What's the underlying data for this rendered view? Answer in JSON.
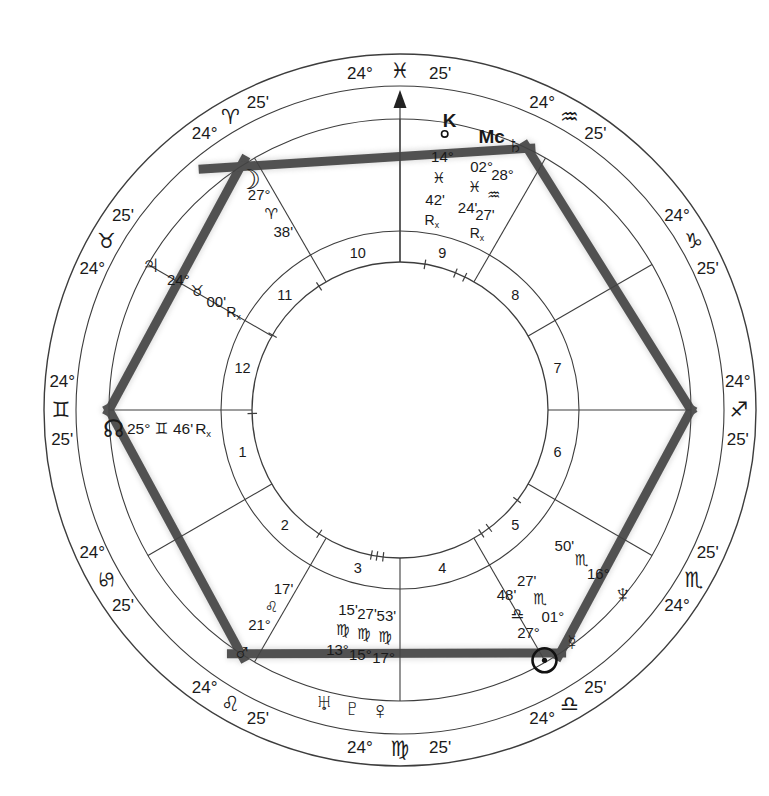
{
  "page_top": {
    "fragments": [
      {
        "ch": "g",
        "x": 103
      },
      {
        "ch": "y,",
        "x": 152
      },
      {
        "ch": "y",
        "x": 278
      },
      {
        "ch": "y",
        "x": 350
      },
      {
        "ch": "p",
        "x": 477
      },
      {
        "ch": "g",
        "x": 590
      },
      {
        "ch": "g",
        "x": 617
      }
    ]
  },
  "wheel": {
    "title": "natal chart wheel",
    "cusp_degree": "24°",
    "cusp_minute": "25'",
    "signs": [
      {
        "name": "aries",
        "glyph": "♈"
      },
      {
        "name": "taurus",
        "glyph": "♉"
      },
      {
        "name": "gemini",
        "glyph": "♊"
      },
      {
        "name": "cancer",
        "glyph": "♋"
      },
      {
        "name": "leo",
        "glyph": "♌"
      },
      {
        "name": "virgo",
        "glyph": "♍"
      },
      {
        "name": "libra",
        "glyph": "♎"
      },
      {
        "name": "scorpio",
        "glyph": "♏"
      },
      {
        "name": "sagittarius",
        "glyph": "♐"
      },
      {
        "name": "capricorn",
        "glyph": "♑"
      },
      {
        "name": "aquarius",
        "glyph": "♒"
      },
      {
        "name": "pisces",
        "glyph": "♓"
      }
    ],
    "house_numbers": [
      "1",
      "2",
      "3",
      "4",
      "5",
      "6",
      "7",
      "8",
      "9",
      "10",
      "11",
      "12"
    ],
    "retrograde_label": "R",
    "retrograde_sub": "x",
    "planets": [
      {
        "id": "sun",
        "name": "Sun",
        "glyph_type": "disc",
        "degree": "27°",
        "sign_glyph": "♎",
        "minute": "48'",
        "retrograde": false,
        "sign_index": 6,
        "deg": 27,
        "min": 48,
        "display_theta": 300
      },
      {
        "id": "moon",
        "name": "Moon",
        "glyph": "☽",
        "glyph_size": 27,
        "glyph_r": 276,
        "degree": "27°",
        "sign_glyph": "♈",
        "minute": "38'",
        "retrograde": false,
        "sign_index": 0,
        "deg": 27,
        "min": 38
      },
      {
        "id": "mercury",
        "name": "Mercury",
        "glyph": "☿",
        "glyph_size": 22,
        "degree": "01°",
        "sign_glyph": "♏",
        "minute": "27'",
        "retrograde": false,
        "sign_index": 7,
        "deg": 1,
        "min": 27,
        "display_theta": 306.5
      },
      {
        "id": "venus",
        "name": "Venus",
        "glyph": "♀",
        "glyph_size": 25,
        "glyph_r": 301,
        "degree": "17°",
        "sign_glyph": "♍",
        "minute": "53'",
        "retrograde": false,
        "sign_index": 5,
        "deg": 17,
        "min": 53,
        "display_theta": 266.2,
        "compact": true
      },
      {
        "id": "mars",
        "name": "Mars",
        "glyph": "♂",
        "glyph_size": 25,
        "degree": "21°",
        "sign_glyph": "♌",
        "minute": "17'",
        "retrograde": false,
        "sign_index": 4,
        "deg": 21,
        "min": 17
      },
      {
        "id": "jupiter",
        "name": "Jupiter",
        "glyph": "♃",
        "glyph_size": 26,
        "degree": "24°",
        "sign_glyph": "♉",
        "minute": "00'",
        "retrograde": true,
        "sign_index": 1,
        "deg": 24,
        "min": 0
      },
      {
        "id": "saturn",
        "name": "Saturn",
        "glyph": "♄",
        "glyph_size": 24,
        "degree": "28°",
        "sign_glyph": "♒",
        "minute": "27'",
        "retrograde": true,
        "sign_index": 10,
        "deg": 28,
        "min": 27,
        "display_theta": 66.5
      },
      {
        "id": "uranus",
        "name": "Uranus",
        "glyph": "♅",
        "glyph_size": 24,
        "glyph_r": 301,
        "degree": "13°",
        "sign_glyph": "♍",
        "minute": "15'",
        "retrograde": false,
        "sign_index": 5,
        "deg": 13,
        "min": 15,
        "display_theta": 255.4,
        "compact": true
      },
      {
        "id": "neptune",
        "name": "Neptune",
        "glyph": "♆",
        "glyph_size": 26,
        "degree": "16°",
        "sign_glyph": "♏",
        "minute": "50'",
        "retrograde": false,
        "sign_index": 7,
        "deg": 16,
        "min": 50,
        "display_theta": 320.5
      },
      {
        "id": "pluto",
        "name": "Pluto",
        "glyph": "♇",
        "glyph_size": 24,
        "glyph_r": 301,
        "degree": "15°",
        "sign_glyph": "♍",
        "minute": "27'",
        "retrograde": false,
        "sign_index": 5,
        "deg": 15,
        "min": 27,
        "display_theta": 260.8,
        "compact": true
      },
      {
        "id": "north-node",
        "name": "North Node",
        "glyph": "☊",
        "glyph_size": 24,
        "glyph_r": 287,
        "degree": "25°",
        "sign_glyph": "♊",
        "minute": "46'",
        "retrograde": true,
        "sign_index": 2,
        "deg": 25,
        "min": 46,
        "display_theta": 183.8,
        "layout": "horizontal"
      },
      {
        "id": "chiron",
        "name": "Chiron",
        "glyph_type": "chiron",
        "chiron_letter": "K",
        "degree": "14°",
        "sign_glyph": "♓",
        "minute": "42'",
        "retrograde": true,
        "sign_index": 11,
        "deg": 14,
        "min": 42,
        "display_theta": 80.5
      },
      {
        "id": "mc",
        "name": "Midheaven",
        "label": "Mc",
        "degree": "02°",
        "sign_glyph": "♓",
        "minute": "24'",
        "retrograde": false,
        "sign_index": 11,
        "deg": 2,
        "min": 24,
        "display_theta": 71.5
      }
    ],
    "aspect_pattern": {
      "name": "grand-sextile-hexagon",
      "vertices": [
        "asc",
        "moon",
        "saturn",
        "dsc",
        "sun",
        "mars"
      ]
    },
    "colors": {
      "ink": "#1a1a1a",
      "line": "#3d3d3d",
      "aspect": "#424242",
      "paper": "#ffffff"
    }
  }
}
